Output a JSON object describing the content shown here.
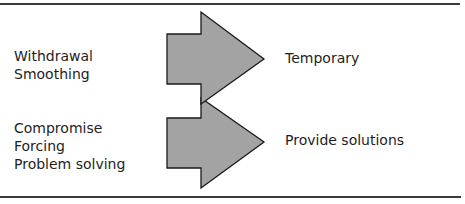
{
  "diagram": {
    "colors": {
      "arrow_fill": "#a3a3a3",
      "arrow_stroke": "#1a1a1a",
      "rule": "#3a3a3a",
      "text": "#1e1e1e"
    },
    "rows": [
      {
        "inputs": [
          "Withdrawal",
          "Smoothing"
        ],
        "outcome": "Temporary"
      },
      {
        "inputs": [
          "Compromise",
          "Forcing",
          "Problem solving"
        ],
        "outcome": "Provide solutions"
      }
    ]
  }
}
